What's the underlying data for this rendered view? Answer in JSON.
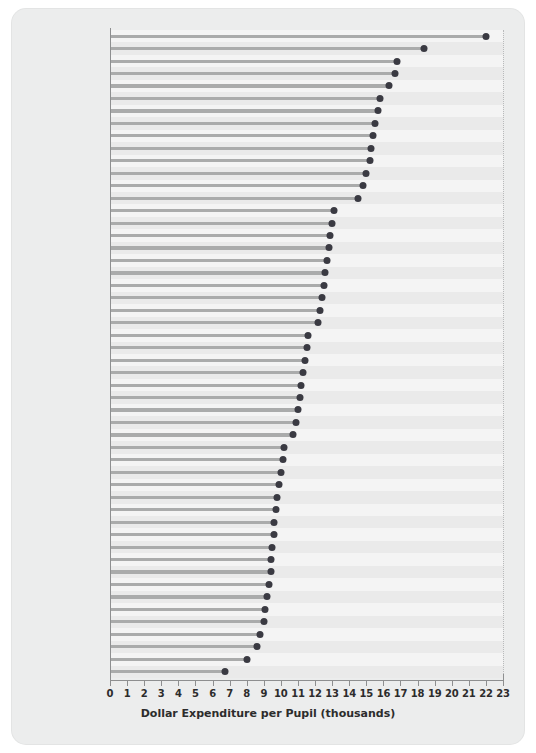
{
  "chart_data": {
    "type": "bar",
    "orientation": "horizontal",
    "style": "dot-plot",
    "title": "",
    "xlabel": "Dollar Expenditure per Pupil (thousands)",
    "ylabel": "",
    "xlim": [
      0,
      23
    ],
    "xticks": [
      0,
      1,
      2,
      3,
      4,
      5,
      6,
      7,
      8,
      9,
      10,
      11,
      12,
      13,
      14,
      15,
      16,
      17,
      18,
      19,
      20,
      21,
      22,
      23
    ],
    "grid": "vertical-dotted",
    "legend": "none",
    "categories": [
      "Vermont",
      "Rhode Island",
      "Wyoming",
      "New Jersey",
      "Maine",
      "Massachusetts",
      "Delaware",
      "Maryland",
      "New York",
      "Arkansas",
      "Connecticut",
      "New Hampshire",
      "Pennsylvania",
      "Dist. of Columbia",
      "Michigan",
      "Hawaii",
      "Wisconsin",
      "Virginia",
      "Illinois",
      "West Virginia",
      "Minnesota",
      "Alaska",
      "Montana",
      "Oregon",
      "New Mexico",
      "Louisiana",
      "Nebraska",
      "United States",
      "Georgia",
      "Iowa",
      "Ohio",
      "Washington",
      "Indiana",
      "Colorado",
      "South Carolina",
      "Missouri",
      "Kentucky",
      "Alabama",
      "South Dakota",
      "Texas",
      "Kansan",
      "Tennessee",
      "Florida",
      "North Dakota",
      "Utah",
      "North Carolina",
      "Oklahoma",
      "California",
      "Idaho",
      "Mississippi",
      "Nevada",
      "Arizona"
    ],
    "values": [
      22.0,
      18.4,
      16.8,
      16.7,
      16.3,
      15.8,
      15.7,
      15.5,
      15.4,
      15.3,
      15.2,
      15.0,
      14.8,
      14.5,
      13.1,
      13.0,
      12.9,
      12.8,
      12.7,
      12.6,
      12.5,
      12.4,
      12.3,
      12.2,
      11.6,
      11.5,
      11.4,
      11.3,
      11.2,
      11.1,
      11.0,
      10.9,
      10.7,
      10.2,
      10.1,
      10.0,
      9.9,
      9.8,
      9.7,
      9.6,
      9.6,
      9.5,
      9.4,
      9.4,
      9.3,
      9.2,
      9.1,
      9.0,
      8.8,
      8.6,
      8.0,
      6.75
    ],
    "colors": {
      "dot": "#3a3a42",
      "stem": "#aaabab",
      "panel": "#eceded",
      "plot_background": "#efefef",
      "gridline": "#b9babb",
      "axis": "#8e8f90",
      "text": "#1f1f1f"
    }
  }
}
